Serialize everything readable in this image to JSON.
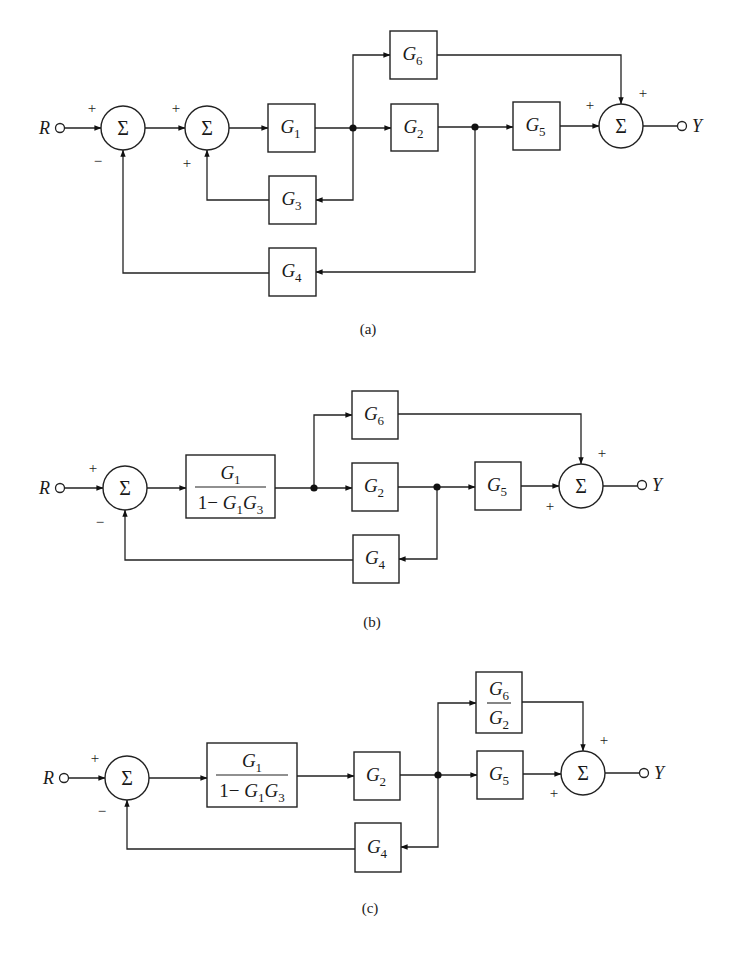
{
  "figure": {
    "colors": {
      "ink": "#222222",
      "background": "#ffffff"
    }
  },
  "diagrams": [
    {
      "id": "a",
      "caption": "(a)",
      "caption_pos": [
        368,
        334
      ],
      "input": {
        "label": "R",
        "x": 60,
        "y": 128
      },
      "output": {
        "label": "Y",
        "x": 682,
        "y": 126
      },
      "summers": [
        {
          "id": "s1",
          "cx": 123,
          "cy": 128,
          "r": 22,
          "symbol": "Σ",
          "signs": [
            {
              "text": "+",
              "x": 92,
              "y": 113
            },
            {
              "text": "−",
              "x": 98,
              "y": 166
            }
          ]
        },
        {
          "id": "s2",
          "cx": 207,
          "cy": 128,
          "r": 22,
          "symbol": "Σ",
          "signs": [
            {
              "text": "+",
              "x": 176,
              "y": 113
            },
            {
              "text": "+",
              "x": 187,
              "y": 168
            }
          ]
        },
        {
          "id": "s3",
          "cx": 621,
          "cy": 126,
          "r": 22,
          "symbol": "Σ",
          "signs": [
            {
              "text": "+",
              "x": 590,
              "y": 110
            },
            {
              "text": "+",
              "x": 643,
              "y": 98
            }
          ]
        }
      ],
      "blocks": [
        {
          "id": "G1",
          "base": "G",
          "sub": "1",
          "x": 268,
          "y": 104,
          "w": 47,
          "h": 48
        },
        {
          "id": "G6",
          "base": "G",
          "sub": "6",
          "x": 390,
          "y": 31,
          "w": 47,
          "h": 48
        },
        {
          "id": "G2",
          "base": "G",
          "sub": "2",
          "x": 391,
          "y": 104,
          "w": 47,
          "h": 47
        },
        {
          "id": "G5",
          "base": "G",
          "sub": "5",
          "x": 513,
          "y": 102,
          "w": 47,
          "h": 48
        },
        {
          "id": "G3",
          "base": "G",
          "sub": "3",
          "x": 269,
          "y": 176,
          "w": 47,
          "h": 48
        },
        {
          "id": "G4",
          "base": "G",
          "sub": "4",
          "x": 269,
          "y": 248,
          "w": 47,
          "h": 48
        }
      ],
      "nodes": [
        {
          "x": 353,
          "y": 128
        },
        {
          "x": 475,
          "y": 127
        }
      ],
      "wires": [
        {
          "pts": [
            [
              64,
              128
            ],
            [
              101,
              128
            ]
          ],
          "arrow": true
        },
        {
          "pts": [
            [
              145,
              128
            ],
            [
              185,
              128
            ]
          ],
          "arrow": true
        },
        {
          "pts": [
            [
              229,
              128
            ],
            [
              268,
              128
            ]
          ],
          "arrow": true
        },
        {
          "pts": [
            [
              315,
              128
            ],
            [
              391,
              128
            ]
          ],
          "arrow": true
        },
        {
          "pts": [
            [
              353,
              128
            ],
            [
              353,
              55
            ],
            [
              390,
              55
            ]
          ],
          "arrow": true
        },
        {
          "pts": [
            [
              437,
              55
            ],
            [
              621,
              55
            ],
            [
              621,
              104
            ]
          ],
          "arrow": true
        },
        {
          "pts": [
            [
              438,
              127
            ],
            [
              513,
              127
            ]
          ],
          "arrow": true
        },
        {
          "pts": [
            [
              560,
              126
            ],
            [
              599,
              126
            ]
          ],
          "arrow": true
        },
        {
          "pts": [
            [
              643,
              126
            ],
            [
              678,
              126
            ]
          ],
          "arrow": false
        },
        {
          "pts": [
            [
              353,
              128
            ],
            [
              353,
              200
            ],
            [
              316,
              200
            ]
          ],
          "arrow": true
        },
        {
          "pts": [
            [
              269,
              200
            ],
            [
              207,
              200
            ],
            [
              207,
              150
            ]
          ],
          "arrow": true
        },
        {
          "pts": [
            [
              475,
              127
            ],
            [
              475,
              272
            ],
            [
              316,
              272
            ]
          ],
          "arrow": true
        },
        {
          "pts": [
            [
              269,
              273
            ],
            [
              123,
              273
            ],
            [
              123,
              150
            ]
          ],
          "arrow": true
        }
      ]
    },
    {
      "id": "b",
      "caption": "(b)",
      "caption_pos": [
        372,
        627
      ],
      "input": {
        "label": "R",
        "x": 60,
        "y": 488
      },
      "output": {
        "label": "Y",
        "x": 642,
        "y": 485
      },
      "summers": [
        {
          "id": "s1",
          "cx": 125,
          "cy": 488,
          "r": 22,
          "symbol": "Σ",
          "signs": [
            {
              "text": "+",
              "x": 93,
              "y": 473
            },
            {
              "text": "−",
              "x": 100,
              "y": 527
            }
          ]
        },
        {
          "id": "s2",
          "cx": 581,
          "cy": 486,
          "r": 22,
          "symbol": "Σ",
          "signs": [
            {
              "text": "+",
              "x": 602,
              "y": 458
            },
            {
              "text": "+",
              "x": 550,
              "y": 511
            }
          ]
        }
      ],
      "blocks": [
        {
          "id": "F1",
          "type": "fraction",
          "num": {
            "base": "G",
            "sub": "1"
          },
          "den": {
            "prefix": "1− ",
            "terms": [
              {
                "base": "G",
                "sub": "1"
              },
              {
                "base": "G",
                "sub": "3"
              }
            ]
          },
          "x": 186,
          "y": 455,
          "w": 89,
          "h": 63
        },
        {
          "id": "G6",
          "base": "G",
          "sub": "6",
          "x": 352,
          "y": 391,
          "w": 46,
          "h": 48
        },
        {
          "id": "G2",
          "base": "G",
          "sub": "2",
          "x": 352,
          "y": 463,
          "w": 46,
          "h": 48
        },
        {
          "id": "G5",
          "base": "G",
          "sub": "5",
          "x": 475,
          "y": 462,
          "w": 46,
          "h": 48
        },
        {
          "id": "G4",
          "base": "G",
          "sub": "4",
          "x": 353,
          "y": 535,
          "w": 46,
          "h": 48
        }
      ],
      "nodes": [
        {
          "x": 314,
          "y": 488
        },
        {
          "x": 437,
          "y": 487
        }
      ],
      "wires": [
        {
          "pts": [
            [
              64,
              488
            ],
            [
              103,
              488
            ]
          ],
          "arrow": true
        },
        {
          "pts": [
            [
              147,
              488
            ],
            [
              186,
              488
            ]
          ],
          "arrow": true
        },
        {
          "pts": [
            [
              275,
              488
            ],
            [
              352,
              488
            ]
          ],
          "arrow": true
        },
        {
          "pts": [
            [
              314,
              488
            ],
            [
              314,
              415
            ],
            [
              352,
              415
            ]
          ],
          "arrow": true
        },
        {
          "pts": [
            [
              398,
              414
            ],
            [
              581,
              414
            ],
            [
              581,
              464
            ]
          ],
          "arrow": true
        },
        {
          "pts": [
            [
              398,
              487
            ],
            [
              475,
              487
            ]
          ],
          "arrow": true
        },
        {
          "pts": [
            [
              521,
              486
            ],
            [
              559,
              486
            ]
          ],
          "arrow": true
        },
        {
          "pts": [
            [
              603,
              486
            ],
            [
              638,
              486
            ]
          ],
          "arrow": false
        },
        {
          "pts": [
            [
              437,
              487
            ],
            [
              437,
              559
            ],
            [
              399,
              559
            ]
          ],
          "arrow": true
        },
        {
          "pts": [
            [
              353,
              560
            ],
            [
              125,
              560
            ],
            [
              125,
              510
            ]
          ],
          "arrow": true
        }
      ]
    },
    {
      "id": "c",
      "caption": "(c)",
      "caption_pos": [
        370,
        913
      ],
      "input": {
        "label": "R",
        "x": 64,
        "y": 778
      },
      "output": {
        "label": "Y",
        "x": 644,
        "y": 773
      },
      "summers": [
        {
          "id": "s1",
          "cx": 127,
          "cy": 778,
          "r": 22,
          "symbol": "Σ",
          "signs": [
            {
              "text": "+",
              "x": 95,
              "y": 763
            },
            {
              "text": "−",
              "x": 102,
              "y": 816
            }
          ]
        },
        {
          "id": "s2",
          "cx": 583,
          "cy": 773,
          "r": 22,
          "symbol": "Σ",
          "signs": [
            {
              "text": "+",
              "x": 604,
              "y": 745
            },
            {
              "text": "+",
              "x": 554,
              "y": 798
            }
          ]
        }
      ],
      "blocks": [
        {
          "id": "F1",
          "type": "fraction",
          "num": {
            "base": "G",
            "sub": "1"
          },
          "den": {
            "prefix": "1− ",
            "terms": [
              {
                "base": "G",
                "sub": "1"
              },
              {
                "base": "G",
                "sub": "3"
              }
            ]
          },
          "x": 207,
          "y": 743,
          "w": 90,
          "h": 64
        },
        {
          "id": "G2",
          "base": "G",
          "sub": "2",
          "x": 354,
          "y": 752,
          "w": 46,
          "h": 48
        },
        {
          "id": "F2",
          "type": "simplefraction",
          "num": {
            "base": "G",
            "sub": "6"
          },
          "den": {
            "base": "G",
            "sub": "2"
          },
          "x": 476,
          "y": 672,
          "w": 46,
          "h": 61
        },
        {
          "id": "G5",
          "base": "G",
          "sub": "5",
          "x": 477,
          "y": 751,
          "w": 46,
          "h": 48
        },
        {
          "id": "G4",
          "base": "G",
          "sub": "4",
          "x": 355,
          "y": 823,
          "w": 46,
          "h": 49
        }
      ],
      "nodes": [
        {
          "x": 438,
          "y": 775
        }
      ],
      "wires": [
        {
          "pts": [
            [
              68,
              778
            ],
            [
              105,
              778
            ]
          ],
          "arrow": true
        },
        {
          "pts": [
            [
              149,
              778
            ],
            [
              207,
              778
            ]
          ],
          "arrow": true
        },
        {
          "pts": [
            [
              297,
              776
            ],
            [
              354,
              776
            ]
          ],
          "arrow": true
        },
        {
          "pts": [
            [
              400,
              775
            ],
            [
              477,
              775
            ]
          ],
          "arrow": true
        },
        {
          "pts": [
            [
              438,
              775
            ],
            [
              438,
              703
            ],
            [
              476,
              703
            ]
          ],
          "arrow": true
        },
        {
          "pts": [
            [
              522,
              702
            ],
            [
              583,
              702
            ],
            [
              583,
              751
            ]
          ],
          "arrow": true
        },
        {
          "pts": [
            [
              523,
              774
            ],
            [
              561,
              774
            ]
          ],
          "arrow": true
        },
        {
          "pts": [
            [
              605,
              773
            ],
            [
              640,
              773
            ]
          ],
          "arrow": false
        },
        {
          "pts": [
            [
              438,
              775
            ],
            [
              438,
              847
            ],
            [
              401,
              847
            ]
          ],
          "arrow": true
        },
        {
          "pts": [
            [
              355,
              849
            ],
            [
              127,
              849
            ],
            [
              127,
              800
            ]
          ],
          "arrow": true
        }
      ]
    }
  ]
}
